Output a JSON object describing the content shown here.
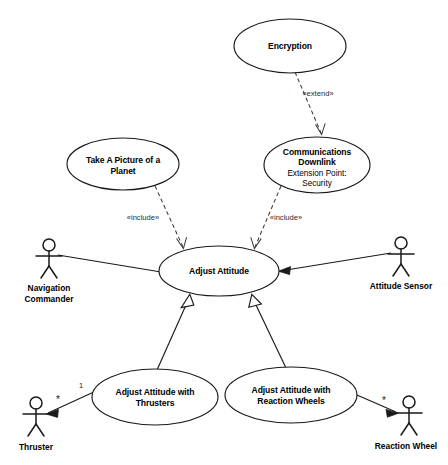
{
  "diagram": {
    "type": "uml-use-case-diagram",
    "use_cases": {
      "encryption": {
        "name": "Encryption"
      },
      "comms_downlink": {
        "name_line1": "Communications",
        "name_line2": "Downlink",
        "extension_point_label": "Extension Point:",
        "extension_point_value": "Security"
      },
      "take_picture": {
        "name_line1": "Take A Picture of a",
        "name_line2": "Planet"
      },
      "adjust_attitude": {
        "name": "Adjust Attitude"
      },
      "adjust_thrusters": {
        "name_line1": "Adjust Attitude with",
        "name_line2": "Thrusters"
      },
      "adjust_reaction_wheels": {
        "name_line1": "Adjust Attitude with",
        "name_line2": "Reaction Wheels"
      }
    },
    "actors": {
      "navigation_commander": {
        "name_line1": "Navigation",
        "name_line2": "Commander"
      },
      "attitude_sensor": {
        "name": "Attitude Sensor"
      },
      "thruster": {
        "name": "Thruster"
      },
      "reaction_wheel": {
        "name": "Reaction Wheel"
      }
    },
    "relationships": {
      "extend_label": "«extend»",
      "include_label_left": "«include»",
      "include_label_right": "«include»",
      "thruster_mult_source": "1",
      "thruster_mult_target": "*",
      "reaction_wheel_mult_source": "1",
      "reaction_wheel_mult_target": "*"
    },
    "colors": {
      "stroke": "#1a1a1a",
      "dashed_stroke": "#3a3a3a",
      "fill": "#ffffff",
      "background": "#ffffff"
    }
  }
}
